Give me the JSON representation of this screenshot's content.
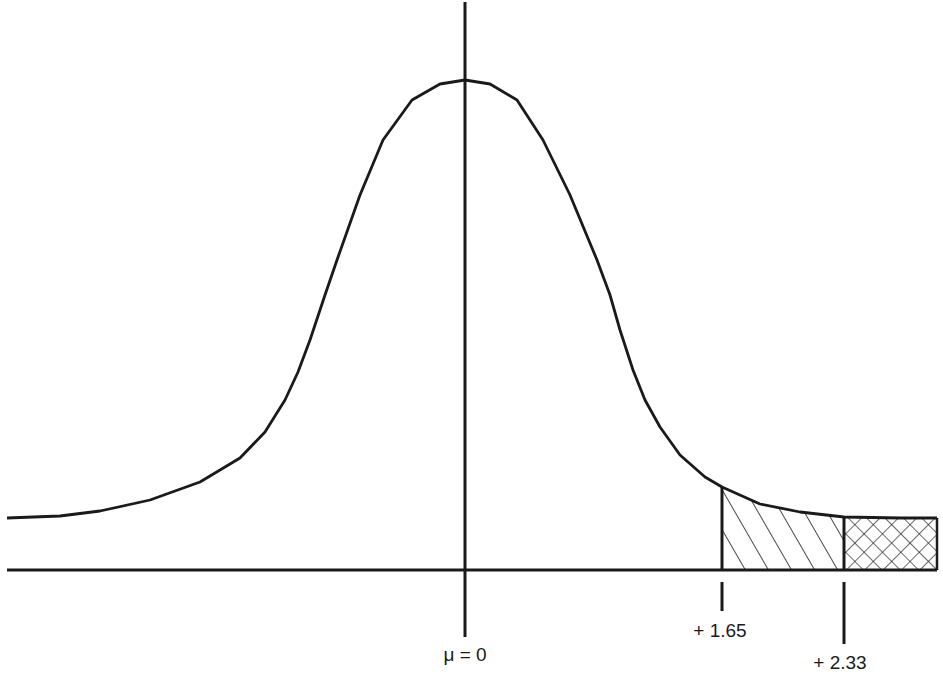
{
  "diagram": {
    "type": "normal-distribution",
    "colors": {
      "ink": "#1a1a1a",
      "background": "#ffffff"
    },
    "curve_points": [
      [
        7,
        518
      ],
      [
        60,
        516
      ],
      [
        100,
        511
      ],
      [
        150,
        500
      ],
      [
        200,
        482
      ],
      [
        240,
        458
      ],
      [
        265,
        432
      ],
      [
        285,
        400
      ],
      [
        298,
        372
      ],
      [
        310,
        340
      ],
      [
        325,
        295
      ],
      [
        337,
        260
      ],
      [
        360,
        195
      ],
      [
        383,
        140
      ],
      [
        412,
        100
      ],
      [
        440,
        84
      ],
      [
        465,
        80
      ],
      [
        490,
        84
      ],
      [
        517,
        100
      ],
      [
        543,
        140
      ],
      [
        570,
        195
      ],
      [
        597,
        260
      ],
      [
        610,
        295
      ],
      [
        620,
        330
      ],
      [
        633,
        370
      ],
      [
        645,
        400
      ],
      [
        660,
        427
      ],
      [
        680,
        455
      ],
      [
        705,
        477
      ],
      [
        722,
        487
      ],
      [
        760,
        504
      ],
      [
        800,
        512
      ],
      [
        844,
        517
      ],
      [
        900,
        518
      ],
      [
        937,
        518
      ]
    ],
    "baseline": {
      "x1": 7,
      "x2": 937,
      "y": 570
    },
    "mean_axis": {
      "x": 465,
      "y1": 2,
      "y2": 637
    },
    "labels": {
      "mean": "μ = 0",
      "critical_1": "+ 1.65",
      "critical_2": "+ 2.33"
    },
    "regions": [
      {
        "name": "single-hatched-region",
        "from_x": 722,
        "to_x": 844,
        "pattern": "diagonal",
        "between": [
          "+ 1.65",
          "+ 2.33"
        ]
      },
      {
        "name": "cross-hatched-region",
        "from_x": 844,
        "to_x": 937,
        "pattern": "crosshatch",
        "beyond": "+ 2.33"
      }
    ],
    "ticks": [
      {
        "name": "tick-1.65",
        "x": 722,
        "y1": 582,
        "y2": 611,
        "label_x": 720,
        "label_y": 637
      },
      {
        "name": "tick-2.33",
        "x": 844,
        "y1": 582,
        "y2": 644,
        "label_x": 840,
        "label_y": 669
      }
    ]
  }
}
